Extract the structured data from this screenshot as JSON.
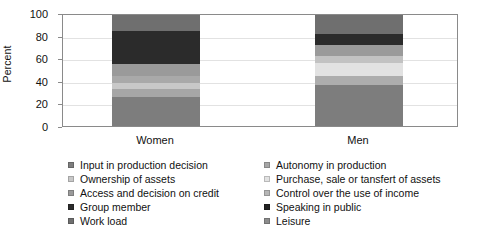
{
  "chart_data": {
    "type": "bar",
    "subtype": "stacked-percent",
    "title": "",
    "xlabel": "",
    "ylabel": "Percent",
    "ylim": [
      0,
      100
    ],
    "yticks": [
      0,
      20,
      40,
      60,
      80,
      100
    ],
    "grid": true,
    "legend_position": "bottom",
    "legend_columns": 2,
    "categories": [
      "Women",
      "Men"
    ],
    "series": [
      {
        "name": "Input in production decision",
        "color": "#7a7a7a",
        "values": [
          26,
          37
        ]
      },
      {
        "name": "Autonomy in production",
        "color": "#9c9c9c",
        "values": [
          7,
          8
        ]
      },
      {
        "name": "Ownership of assets",
        "color": "#b4b4b4",
        "values": [
          6,
          12
        ]
      },
      {
        "name": "Purchase, sale or tansfert of assets",
        "color": "#e0e0e0",
        "values": [
          6,
          6
        ]
      },
      {
        "name": "Access and decision on credit",
        "color": "#8e8e8e",
        "values": [
          11,
          10
        ]
      },
      {
        "name": "Control over the use of income",
        "color": "#a8a8a8",
        "values": [
          0,
          0
        ]
      },
      {
        "name": "Group member",
        "color": "#2b2b2b",
        "values": [
          30,
          10
        ]
      },
      {
        "name": "Speaking in public",
        "color": "#222222",
        "values": [
          0,
          0
        ]
      },
      {
        "name": "Work load",
        "color": "#8c8c8c",
        "values": [
          14,
          17
        ]
      },
      {
        "name": "Leisure",
        "color": "#7f7f7f",
        "values": [
          0,
          0
        ]
      }
    ],
    "stacks": {
      "Women": [
        {
          "label": "Input in production decision",
          "value": 26,
          "color": "#7d7d7d"
        },
        {
          "label": "Autonomy in production",
          "value": 7,
          "color": "#a6a6a6"
        },
        {
          "label": "Ownership of assets",
          "value": 6,
          "color": "#c8c8c8"
        },
        {
          "label": "Purchase, sale or tansfert of assets",
          "value": 6,
          "color": "#a9a9a9"
        },
        {
          "label": "Access and decision on credit",
          "value": 11,
          "color": "#9a9a9a"
        },
        {
          "label": "Group member",
          "value": 30,
          "color": "#2b2b2b"
        },
        {
          "label": "Work load",
          "value": 14,
          "color": "#6f6f6f"
        }
      ],
      "Men": [
        {
          "label": "Input in production decision",
          "value": 37,
          "color": "#7d7d7d"
        },
        {
          "label": "Autonomy in production",
          "value": 8,
          "color": "#adadad"
        },
        {
          "label": "Ownership of assets",
          "value": 12,
          "color": "#e2e2e2"
        },
        {
          "label": "Purchase, sale or tansfert of assets",
          "value": 6,
          "color": "#c2c2c2"
        },
        {
          "label": "Access and decision on credit",
          "value": 10,
          "color": "#9a9a9a"
        },
        {
          "label": "Group member",
          "value": 10,
          "color": "#2b2b2b"
        },
        {
          "label": "Work load",
          "value": 17,
          "color": "#6f6f6f"
        }
      ]
    }
  },
  "axis": {
    "ylabel": "Percent",
    "ytick_labels": [
      "100",
      "80",
      "60",
      "40",
      "20",
      "0"
    ],
    "xtick_labels": [
      "Women",
      "Men"
    ]
  },
  "legend": {
    "left_column": [
      {
        "label": "Input in production decision",
        "color": "#7d7d7d"
      },
      {
        "label": "Ownership of assets",
        "color": "#c8c8c8"
      },
      {
        "label": "Access and decision on credit",
        "color": "#9a9a9a"
      },
      {
        "label": "Group member",
        "color": "#2b2b2b"
      },
      {
        "label": "Work load",
        "color": "#6f6f6f"
      }
    ],
    "right_column": [
      {
        "label": "Autonomy in production",
        "color": "#a6a6a6"
      },
      {
        "label": "Purchase, sale or tansfert of assets",
        "color": "#e2e2e2"
      },
      {
        "label": "Control over the use of income",
        "color": "#b6b6b6"
      },
      {
        "label": "Speaking in public",
        "color": "#222222"
      },
      {
        "label": "Leisure",
        "color": "#8c8c8c"
      }
    ]
  }
}
